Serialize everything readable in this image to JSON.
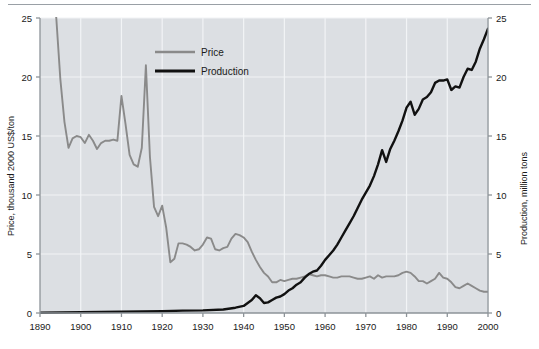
{
  "chart_data": {
    "type": "line",
    "title": "",
    "xlabel": "",
    "ylabel": "Price, thousand 2000 US$/ton",
    "y2label": "Production, million tons",
    "xlim": [
      1890,
      2000
    ],
    "ylim": [
      0,
      25
    ],
    "y2lim": [
      0,
      25
    ],
    "grid": true,
    "legend_position": "top-center",
    "xticks": [
      1890,
      1900,
      1910,
      1920,
      1930,
      1940,
      1950,
      1960,
      1970,
      1980,
      1990,
      2000
    ],
    "xtick_labels": [
      "1890",
      "1900",
      "1910",
      "1920",
      "1930",
      "1940",
      "1950",
      "1960",
      "1970",
      "1980",
      "1990",
      "2000"
    ],
    "yticks": [
      0,
      5,
      10,
      15,
      20,
      25
    ],
    "ytick_labels": [
      "0",
      "5",
      "10",
      "15",
      "20",
      "25"
    ],
    "y2ticks": [
      0,
      5,
      10,
      15,
      20,
      25
    ],
    "y2tick_labels": [
      "0",
      "5",
      "10",
      "15",
      "20",
      "25"
    ],
    "series": [
      {
        "name": "Price",
        "axis": "left",
        "color": "#8a8a8a",
        "x": [
          1893,
          1894,
          1895,
          1896,
          1897,
          1898,
          1899,
          1900,
          1901,
          1902,
          1903,
          1904,
          1905,
          1906,
          1907,
          1908,
          1909,
          1910,
          1911,
          1912,
          1913,
          1914,
          1915,
          1916,
          1917,
          1918,
          1919,
          1920,
          1921,
          1922,
          1923,
          1924,
          1925,
          1926,
          1927,
          1928,
          1929,
          1930,
          1931,
          1932,
          1933,
          1934,
          1935,
          1936,
          1937,
          1938,
          1939,
          1940,
          1941,
          1942,
          1943,
          1944,
          1945,
          1946,
          1947,
          1948,
          1949,
          1950,
          1951,
          1952,
          1953,
          1954,
          1955,
          1956,
          1957,
          1958,
          1959,
          1960,
          1961,
          1962,
          1963,
          1964,
          1965,
          1966,
          1967,
          1968,
          1969,
          1970,
          1971,
          1972,
          1973,
          1974,
          1975,
          1976,
          1977,
          1978,
          1979,
          1980,
          1981,
          1982,
          1983,
          1984,
          1985,
          1986,
          1987,
          1988,
          1989,
          1990,
          1991,
          1992,
          1993,
          1994,
          1995,
          1996,
          1997,
          1998,
          1999,
          2000
        ],
        "y": [
          27.5,
          25.0,
          19.8,
          16.2,
          14.0,
          14.8,
          15.0,
          14.9,
          14.4,
          15.1,
          14.6,
          13.9,
          14.4,
          14.6,
          14.6,
          14.7,
          14.6,
          18.4,
          16.0,
          13.4,
          12.6,
          12.4,
          14.0,
          21.0,
          13.2,
          9.0,
          8.2,
          9.1,
          7.2,
          4.3,
          4.6,
          5.9,
          5.9,
          5.8,
          5.6,
          5.3,
          5.4,
          5.8,
          6.4,
          6.3,
          5.4,
          5.3,
          5.5,
          5.6,
          6.3,
          6.7,
          6.6,
          6.4,
          6.0,
          5.2,
          4.5,
          3.9,
          3.4,
          3.1,
          2.6,
          2.6,
          2.8,
          2.7,
          2.8,
          2.9,
          2.9,
          3.0,
          3.1,
          3.3,
          3.2,
          3.1,
          3.2,
          3.2,
          3.1,
          3.0,
          3.0,
          3.1,
          3.1,
          3.1,
          3.0,
          2.9,
          2.9,
          3.0,
          3.1,
          2.9,
          3.2,
          3.0,
          3.1,
          3.1,
          3.1,
          3.2,
          3.4,
          3.5,
          3.4,
          3.1,
          2.7,
          2.7,
          2.5,
          2.7,
          2.9,
          3.4,
          3.0,
          2.9,
          2.6,
          2.2,
          2.1,
          2.3,
          2.5,
          2.3,
          2.1,
          1.9,
          1.8,
          1.8
        ]
      },
      {
        "name": "Production",
        "axis": "right",
        "color": "#111111",
        "x": [
          1890,
          1895,
          1900,
          1905,
          1910,
          1915,
          1920,
          1925,
          1930,
          1935,
          1938,
          1940,
          1941,
          1942,
          1943,
          1944,
          1945,
          1946,
          1947,
          1948,
          1949,
          1950,
          1951,
          1952,
          1953,
          1954,
          1955,
          1956,
          1957,
          1958,
          1959,
          1960,
          1961,
          1962,
          1963,
          1964,
          1965,
          1966,
          1967,
          1968,
          1969,
          1970,
          1971,
          1972,
          1973,
          1974,
          1975,
          1976,
          1977,
          1978,
          1979,
          1980,
          1981,
          1982,
          1983,
          1984,
          1985,
          1986,
          1987,
          1988,
          1989,
          1990,
          1991,
          1992,
          1993,
          1994,
          1995,
          1996,
          1997,
          1998,
          1999,
          2000
        ],
        "y": [
          0.02,
          0.04,
          0.06,
          0.08,
          0.1,
          0.13,
          0.15,
          0.2,
          0.22,
          0.3,
          0.45,
          0.6,
          0.85,
          1.1,
          1.5,
          1.25,
          0.85,
          0.9,
          1.1,
          1.3,
          1.4,
          1.6,
          1.9,
          2.1,
          2.4,
          2.6,
          3.0,
          3.3,
          3.5,
          3.6,
          4.0,
          4.5,
          4.9,
          5.3,
          5.8,
          6.4,
          7.0,
          7.6,
          8.2,
          8.9,
          9.6,
          10.2,
          10.8,
          11.6,
          12.6,
          13.8,
          12.8,
          13.9,
          14.6,
          15.4,
          16.3,
          17.4,
          17.9,
          16.8,
          17.3,
          18.1,
          18.3,
          18.7,
          19.5,
          19.7,
          19.7,
          19.8,
          18.9,
          19.2,
          19.1,
          20.0,
          20.7,
          20.6,
          21.3,
          22.4,
          23.2,
          24.1
        ]
      }
    ],
    "legend": [
      {
        "label": "Price",
        "color": "#8a8a8a"
      },
      {
        "label": "Production",
        "color": "#111111"
      }
    ],
    "plot_background": "#dcdfe3",
    "gridline_color": "#f2f4f6"
  }
}
